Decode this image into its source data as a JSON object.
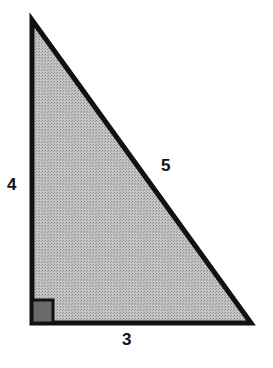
{
  "diagram": {
    "type": "right-triangle",
    "sides": {
      "vertical_leg": "4",
      "horizontal_leg": "3",
      "hypotenuse": "5"
    },
    "fill_color": "#b8b8b8",
    "stroke_color": "#111111",
    "right_angle_marker_color": "#6a6a6a"
  }
}
